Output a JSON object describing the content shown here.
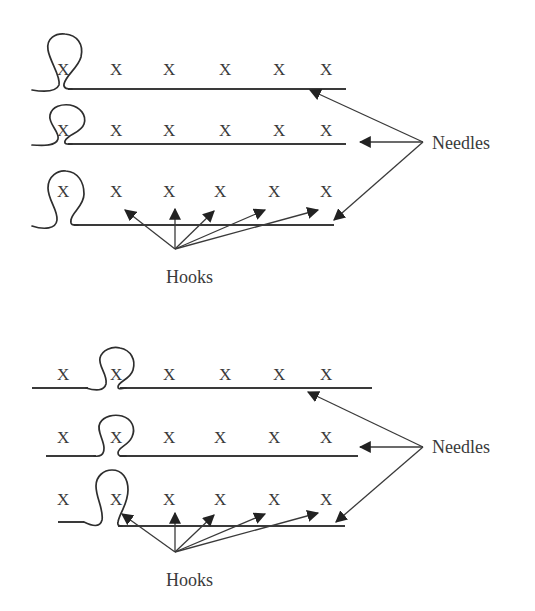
{
  "diagram": {
    "colors": {
      "ink": "#3a3a3a",
      "background": "#ffffff"
    },
    "stitch_symbol": "X",
    "panels": [
      {
        "id": "top",
        "rows": [
          {
            "marks": [
              "X",
              "X",
              "X",
              "X",
              "X",
              "X"
            ],
            "loop_position": 1
          },
          {
            "marks": [
              "X",
              "X",
              "X",
              "X",
              "X",
              "X"
            ],
            "loop_position": 1
          },
          {
            "marks": [
              "X",
              "X",
              "X",
              "X",
              "X",
              "X"
            ],
            "loop_position": 1
          }
        ],
        "needles_label": "Needles",
        "hooks_label": "Hooks"
      },
      {
        "id": "bottom",
        "rows": [
          {
            "marks": [
              "X",
              "X",
              "X",
              "X",
              "X",
              "X"
            ],
            "loop_position": 2
          },
          {
            "marks": [
              "X",
              "X",
              "X",
              "X",
              "X",
              "X"
            ],
            "loop_position": 2
          },
          {
            "marks": [
              "X",
              "X",
              "X",
              "X",
              "X",
              "X"
            ],
            "loop_position": 2
          }
        ],
        "needles_label": "Needles",
        "hooks_label": "Hooks"
      }
    ]
  }
}
